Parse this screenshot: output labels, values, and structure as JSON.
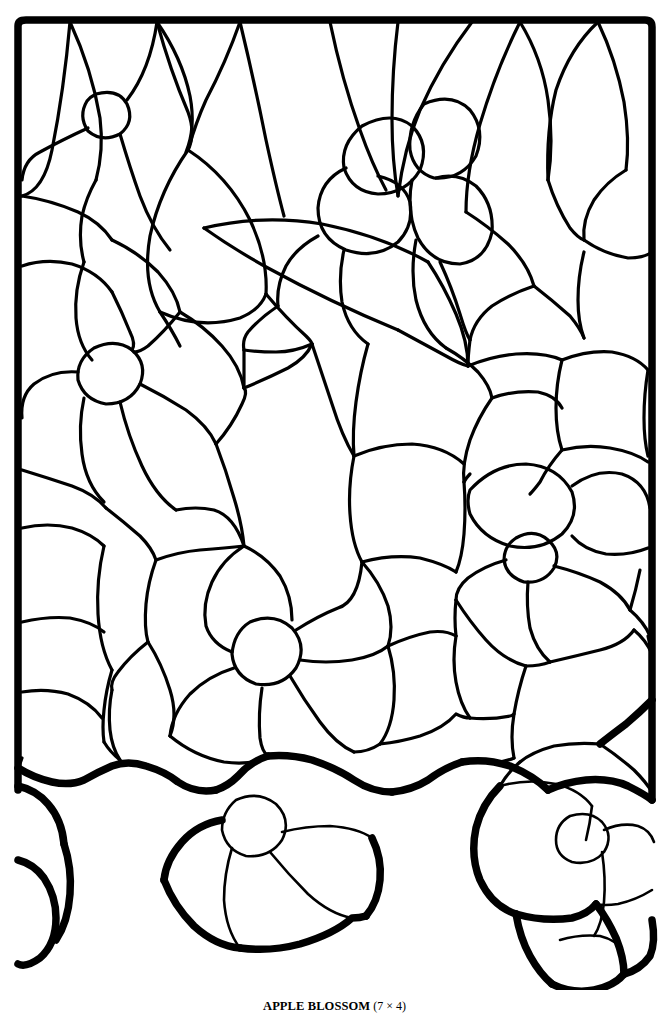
{
  "document": {
    "kind": "stained-glass-pattern-sheet",
    "background_color": "#ffffff",
    "line_color": "#000000"
  },
  "caption": {
    "title": "APPLE BLOSSOM",
    "size": "(7 × 4)"
  },
  "pattern": {
    "name": "Apple Blossom stained glass came pattern",
    "frame": {
      "left": 14,
      "top": 18,
      "right": 655,
      "description": "Heavy rectangular lead border, open and irregular along the bottom edge"
    },
    "motifs": [
      "five-petal blossom upper-left",
      "five-petal blossom middle-left",
      "blossom cluster upper-right",
      "large pointed leaf upper-center",
      "long curving leaf mid-center",
      "blossom cluster mid-right",
      "central blossom lower-center",
      "pendant blossom bottom-center",
      "blossom cluster bottom-right",
      "bud shapes along bottom edge"
    ],
    "piece_count_note": "Approximately 120 glass pieces"
  }
}
